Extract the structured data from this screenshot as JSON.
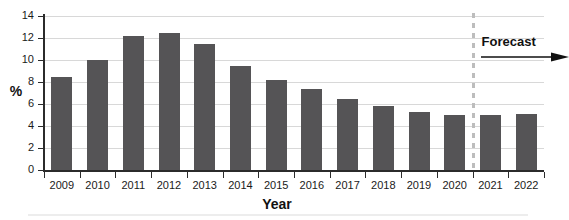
{
  "chart_data": {
    "type": "bar",
    "title": "",
    "subtitle": "",
    "xlabel": "Year",
    "ylabel": "%",
    "categories": [
      "2009",
      "2010",
      "2011",
      "2012",
      "2013",
      "2014",
      "2015",
      "2016",
      "2017",
      "2018",
      "2019",
      "2020",
      "2021",
      "2022"
    ],
    "values": [
      8.5,
      10.0,
      12.2,
      12.5,
      11.5,
      9.5,
      8.2,
      7.4,
      6.5,
      5.8,
      5.3,
      5.0,
      5.0,
      5.1
    ],
    "series": [
      {
        "name": "",
        "values": [
          8.5,
          10.0,
          12.2,
          12.5,
          11.5,
          9.5,
          8.2,
          7.4,
          6.5,
          5.8,
          5.3,
          5.0,
          5.0,
          5.1
        ]
      }
    ],
    "ylim": [
      0,
      14
    ],
    "yticks": [
      0,
      2,
      4,
      6,
      8,
      10,
      12,
      14
    ],
    "ytick_labels": [
      "0",
      "2",
      "4",
      "6",
      "8",
      "10",
      "12",
      "14"
    ],
    "grid": true,
    "legend": false,
    "legend_position": "none",
    "bar_color": "#555456",
    "gridline_color": "#d8d8d8",
    "axis_color": "#2b2b2b",
    "annotations": [
      {
        "name": "forecast-divider",
        "kind": "vertical-dashed-line",
        "label": "Forecast",
        "color": "#bdbdbd",
        "between_categories": [
          "2020",
          "2021"
        ],
        "arrow_direction": "right"
      }
    ]
  },
  "axes": {
    "y_title": "%",
    "x_title": "Year"
  },
  "forecast": {
    "label": "Forecast",
    "arrow_icon": "arrow-right-icon"
  }
}
